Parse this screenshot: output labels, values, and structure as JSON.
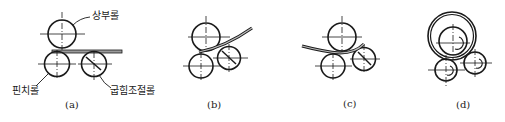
{
  "figure": {
    "panels": [
      {
        "id": "a",
        "caption": "(a)"
      },
      {
        "id": "b",
        "caption": "(b)"
      },
      {
        "id": "c",
        "caption": "(c)"
      },
      {
        "id": "d",
        "caption": "(d)"
      }
    ],
    "labels": {
      "upper_roll": "상부롤",
      "pinch_roll": "핀치롤",
      "bending_adjust_roll": "굽힘조절롤"
    },
    "colors": {
      "ink": "#1a1a1a",
      "plate_fill": "#9a9a9a"
    }
  }
}
